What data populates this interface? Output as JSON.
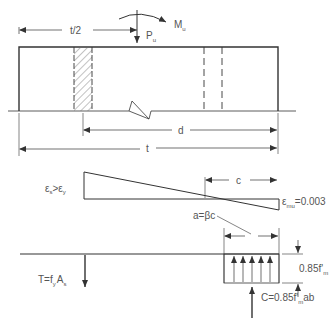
{
  "diagram": {
    "colors": {
      "line": "#333333",
      "text": "#555555",
      "background": "#ffffff"
    },
    "wall_section": {
      "load_label": "P",
      "load_sub": "u",
      "moment_label": "M",
      "moment_sub": "u",
      "half_thickness_label": "t/2",
      "effective_depth_label": "d",
      "thickness_label": "t"
    },
    "strain_diagram": {
      "steel_strain_label": "εs>εy",
      "steel_strain_main": "ε",
      "steel_strain_sub1": "s",
      "steel_strain_op": ">",
      "steel_strain_main2": "ε",
      "steel_strain_sub2": "y",
      "neutral_axis_label": "c",
      "masonry_strain_main": "ε",
      "masonry_strain_sub": "mu",
      "masonry_strain_value": "=0.003"
    },
    "stress_diagram": {
      "block_depth_label": "a=βc",
      "stress_main": "0.85f'",
      "stress_sub": "m",
      "tension_main": "T=f",
      "tension_sub1": "y",
      "tension_mid": "A",
      "tension_sub2": "s",
      "compression_main": "C=0.85f'",
      "compression_sub": "m",
      "compression_tail": "ab"
    }
  }
}
